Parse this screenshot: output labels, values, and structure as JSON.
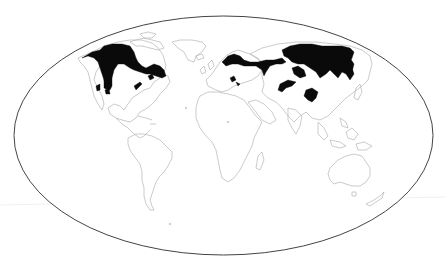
{
  "map": {
    "projection": "Mollweide",
    "background": "#ffffff",
    "outline_color": "#444444",
    "coastline_color": "#b4b4b4",
    "highlight_color": "#0a0a0a",
    "highlighted_region_label": "Boreal forest (taiga) distribution",
    "continents": [
      "North America",
      "South America",
      "Europe",
      "Africa",
      "Asia",
      "Australia",
      "Greenland",
      "New Zealand",
      "Madagascar"
    ],
    "highlighted_areas": [
      "Alaska and western Canada",
      "Central and eastern Canada (Quebec/Labrador)",
      "Rocky Mountains (USA) patches",
      "Appalachian patches",
      "Scandinavia and northern Russia",
      "Siberia",
      "Central Asian mountain patches",
      "Alps and Carpathians patches",
      "Mongolia/Northeast China patches",
      "Kamchatka / Russian Far East"
    ]
  }
}
